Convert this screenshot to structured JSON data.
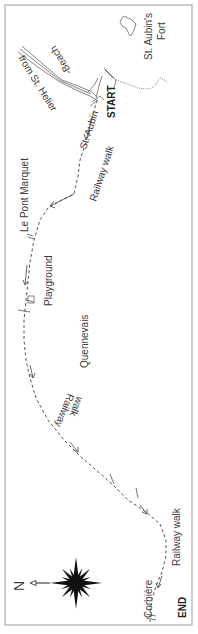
{
  "map": {
    "title": "St. Aubin to Corbière Railway Walk",
    "colors": {
      "background": "#ffffff",
      "border": "#bdbdbd",
      "text": "#3a3a3a",
      "route": "#555555"
    },
    "labels": {
      "from_st_helier": "from St. Helier",
      "beach": "-Beach",
      "fort_line1": "St. Aubin's",
      "fort_line2": "Fort",
      "st_aubin": "St. Aubin",
      "start": "START",
      "railway_walk_top": "Railway walk",
      "le_pont_marquet": "Le Pont Marquet",
      "playground": "Playground",
      "quennevais": "Quennevais",
      "railway_walk_mid_line1": "Railway",
      "railway_walk_mid_line2": "walk",
      "railway_walk_bottom": "Railway walk",
      "corbiere": "Corbière",
      "end": "END"
    },
    "compass": {
      "north_label": "N",
      "icon": "compass-rose-icon"
    }
  }
}
